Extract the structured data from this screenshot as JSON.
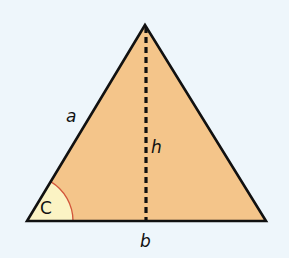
{
  "diagram": {
    "type": "triangle",
    "colors": {
      "background": "#eef6fb",
      "fill": "#f4c58a",
      "angle_fill": "#fbf3c4",
      "angle_arc": "#d2553a",
      "stroke": "#111111"
    },
    "vertices": {
      "apex": [
        145,
        25
      ],
      "left": [
        27,
        221
      ],
      "right": [
        266,
        221
      ]
    },
    "labels": {
      "side_a": "a",
      "height": "h",
      "angle": "C",
      "base": "b"
    }
  }
}
